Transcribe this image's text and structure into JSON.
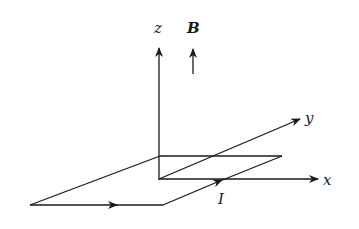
{
  "figure": {
    "labels": {
      "z_axis": "z",
      "x_axis": "x",
      "y_axis": "y",
      "field": "B",
      "current": "I"
    },
    "colors": {
      "stroke": "#1a1a1a",
      "background": "#ffffff"
    }
  }
}
